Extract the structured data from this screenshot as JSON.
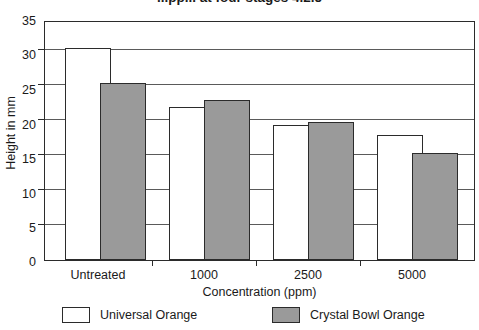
{
  "chart_data": {
    "type": "bar",
    "title": "...pp... at four stages 4.2.5",
    "title_truncated": true,
    "xlabel": "Concentration (ppm)",
    "ylabel": "Height in mm",
    "categories": [
      "Untreated",
      "1000",
      "2500",
      "5000"
    ],
    "series": [
      {
        "name": "Universal Orange",
        "values": [
          31.2,
          22.5,
          19.8,
          18.4
        ]
      },
      {
        "name": "Crystal Bowl Orange",
        "values": [
          26.1,
          23.6,
          20.3,
          15.7
        ]
      }
    ],
    "ylim": [
      0,
      35
    ],
    "yticks": [
      35,
      30,
      25,
      20,
      15,
      10,
      5,
      0
    ],
    "grid": "horizontal",
    "legend_position": "bottom",
    "colors": {
      "series_1_fill": "#ffffff",
      "series_2_fill": "#9a9a9a",
      "outline": "#2b2b2b",
      "gridline": "#5a5a5a",
      "background": "#ffffff"
    }
  }
}
